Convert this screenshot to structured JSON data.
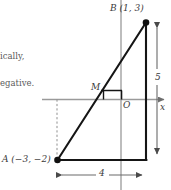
{
  "figure": {
    "type": "coordinate-geometry-diagram",
    "axes": {
      "x_axis_label": "x",
      "origin_label": "O",
      "x_axis_color": "#8c8c8c",
      "y_axis_color": "#8c8c8c"
    },
    "points": [
      {
        "name": "A",
        "label": "A (−3, −2)",
        "x": -3,
        "y": -2
      },
      {
        "name": "B",
        "label": "B (1, 3)",
        "x": 1,
        "y": 3
      },
      {
        "name": "M",
        "label": "M",
        "x": -1,
        "y": 0.5
      }
    ],
    "dimensions": [
      {
        "name": "horizontal-run",
        "label": "4",
        "value": 4
      },
      {
        "name": "vertical-rise",
        "label": "5",
        "value": 5
      }
    ],
    "line_color": "#1a1a1a",
    "guide_color": "#9a9a9a"
  },
  "text_fragments": [
    {
      "id": "fragment-one",
      "text": "ically,"
    },
    {
      "id": "fragment-two",
      "text": "egative."
    }
  ]
}
